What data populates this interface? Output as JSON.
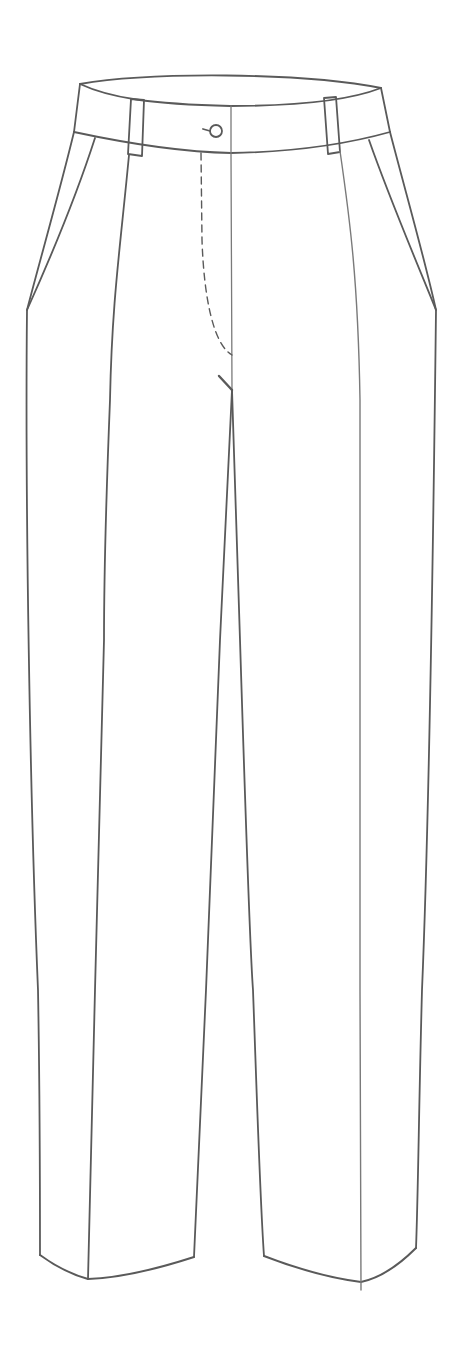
{
  "figure": {
    "subject": "Trousers technical flat sketch (front view)",
    "style": "pencil line drawing",
    "background_color": "#ffffff",
    "line_color": "#5a5a5a",
    "light_line_color": "#8a8a8a"
  },
  "parts": {
    "waistband": "Waistband",
    "belt_loop_left": "Left belt loop",
    "belt_loop_right": "Right belt loop",
    "button": "Waistband button",
    "fly_topstitch": "Fly topstitching (dashed)",
    "center_front": "Center front line",
    "bartack": "Fly bartack",
    "pocket_left": "Left slant pocket",
    "pocket_right": "Right slant pocket",
    "crease_left": "Left leg crease",
    "crease_right": "Right leg crease",
    "leg_left": "Left leg",
    "leg_right": "Right leg",
    "hem_left": "Left hem",
    "hem_right": "Right hem"
  }
}
